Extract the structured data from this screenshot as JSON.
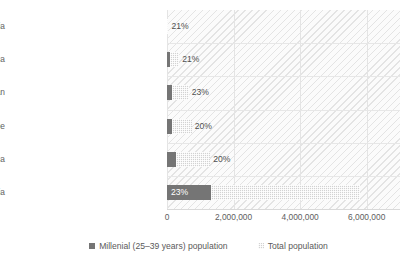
{
  "chart_data": {
    "type": "bar",
    "orientation": "horizontal",
    "stacked": true,
    "title": "",
    "xlabel": "",
    "ylabel": "",
    "categories": [
      "Asia",
      "Africa",
      "Europe",
      "Latin America and the Caribbean",
      "Northern America",
      "Oceania"
    ],
    "series": [
      {
        "name": "Millenial (25–39 years) population",
        "color": "#757575",
        "values": [
          1333000,
          260000,
          148000,
          150000,
          77000,
          9000
        ]
      },
      {
        "name": "Total population",
        "color": "#d2d2d2",
        "values": [
          4467000,
          1040000,
          592000,
          502000,
          290000,
          34000
        ]
      }
    ],
    "totals": [
      5800000,
      1300000,
      740000,
      652000,
      367000,
      43000
    ],
    "data_labels": [
      "23%",
      "20%",
      "20%",
      "23%",
      "21%",
      "21%"
    ],
    "xlim": [
      0,
      7000000
    ],
    "xticks": [
      0,
      2000000,
      4000000,
      6000000
    ],
    "xtick_labels": [
      "0",
      "2,000,000",
      "4,000,000",
      "6,000,000"
    ],
    "grid": true,
    "legend_position": "bottom"
  },
  "axis": {
    "ticks": [
      {
        "label": "0",
        "value": 0
      },
      {
        "label": "2,000,000",
        "value": 2000000
      },
      {
        "label": "4,000,000",
        "value": 4000000
      },
      {
        "label": "6,000,000",
        "value": 6000000
      }
    ]
  },
  "categories": [
    {
      "label": "Oceania",
      "pct": "21%",
      "millenial": 9000,
      "total": 43000
    },
    {
      "label": "Northern America",
      "pct": "21%",
      "millenial": 77000,
      "total": 367000
    },
    {
      "label": "Latin America and the Caribbean",
      "pct": "23%",
      "millenial": 150000,
      "total": 652000
    },
    {
      "label": "Europe",
      "pct": "20%",
      "millenial": 148000,
      "total": 740000
    },
    {
      "label": "Africa",
      "pct": "20%",
      "millenial": 260000,
      "total": 1300000
    },
    {
      "label": "Asia",
      "pct": "23%",
      "millenial": 1333000,
      "total": 5800000
    }
  ],
  "legend": {
    "items": [
      {
        "label": "Millenial (25–39 years) population",
        "swatch": "millenial"
      },
      {
        "label": "Total population",
        "swatch": "total"
      }
    ]
  },
  "colors": {
    "millenial": "#757575",
    "total": "#d2d2d2",
    "plot_background": "#fbfbfb",
    "gridline": "#e4e4e4",
    "text": "#5a5a5a"
  }
}
